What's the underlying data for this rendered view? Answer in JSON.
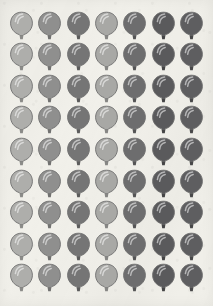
{
  "sheet": {
    "title": "Balloon Icon Grid",
    "background_color": "#f1f0ea",
    "width": 213,
    "height": 306,
    "columns": 7,
    "rows": 9,
    "total_balloons": 63
  },
  "balloon": {
    "icon_name": "balloon-icon",
    "outline_color": "#6f6f6f",
    "highlight_color": "#ffffff"
  },
  "column_colors": [
    "#aeaeab",
    "#8f8f8e",
    "#757575",
    "#a8a8a5",
    "#6d6d6e",
    "#5a5a5c",
    "#5e5e60"
  ],
  "column_tie_colors": [
    "#8b8b88",
    "#727271",
    "#5c5c5c",
    "#868684",
    "#555556",
    "#454546",
    "#484849"
  ],
  "column_labels": [
    "column-1-light-gray",
    "column-2-medium-gray",
    "column-3-dark-gray",
    "column-4-light-gray",
    "column-5-darker-gray",
    "column-6-darkest-gray",
    "column-7-dark-charcoal"
  ],
  "row_labels": [
    "row-1",
    "row-2",
    "row-3",
    "row-4",
    "row-5",
    "row-6",
    "row-7",
    "row-8",
    "row-9"
  ]
}
